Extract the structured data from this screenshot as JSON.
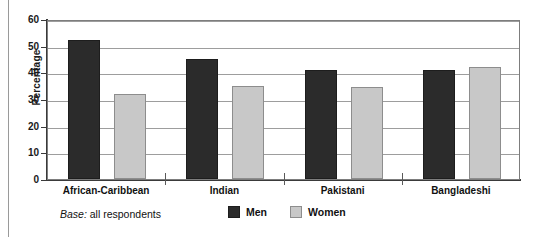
{
  "chart_data": {
    "type": "bar",
    "title": "",
    "xlabel": "",
    "ylabel": "Percentage",
    "ylim": [
      0,
      60
    ],
    "yticks": [
      0,
      10,
      20,
      30,
      40,
      50,
      60
    ],
    "ytick_labels": [
      "0",
      "10",
      "20",
      "30",
      "40",
      "50",
      "60"
    ],
    "grid": true,
    "legend_position": "bottom",
    "categories": [
      "African-Caribbean",
      "Indian",
      "Pakistani",
      "Bangladeshi"
    ],
    "series": [
      {
        "name": "Men",
        "color": "#2b2b2b",
        "values": [
          52,
          45,
          41,
          41
        ]
      },
      {
        "name": "Women",
        "color": "#c8c8c8",
        "values": [
          32,
          35,
          34.5,
          42
        ]
      }
    ],
    "annotations": {
      "base_word": "Base:",
      "base_text": " all respondents"
    }
  }
}
